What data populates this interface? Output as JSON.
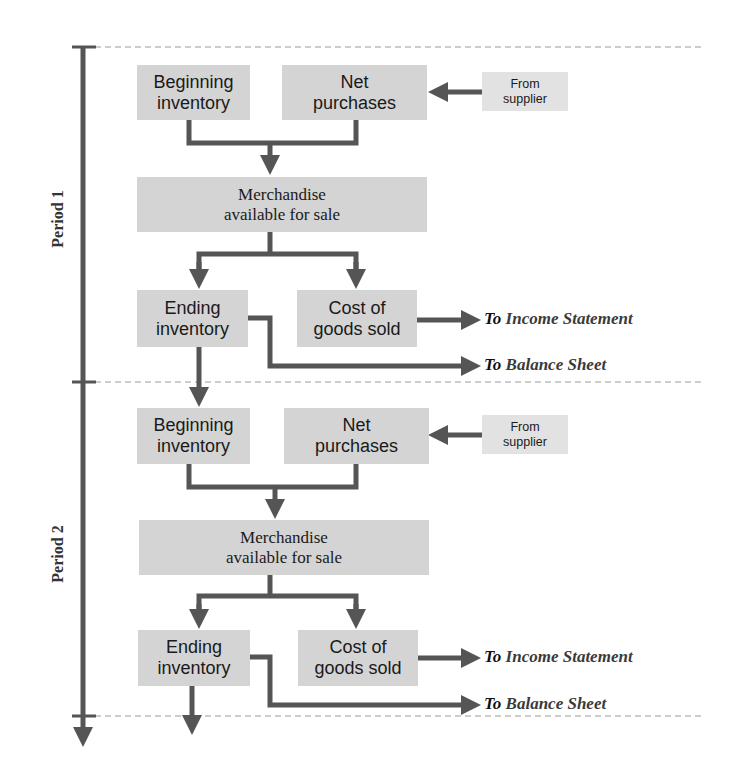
{
  "diagram": {
    "type": "flowchart",
    "colors": {
      "box_fill": "#d4d4d4",
      "supplier_fill": "#e2e2e2",
      "arrow": "#555555",
      "dashed_divider": "#9a9a9a",
      "text": "#1a1a1a"
    },
    "periods": [
      {
        "label": "Period 1",
        "beginning_inventory": "Beginning inventory",
        "beginning_inventory_lines": [
          "Beginning",
          "inventory"
        ],
        "net_purchases_lines": [
          "Net",
          "purchases"
        ],
        "from_supplier_lines": [
          "From",
          "supplier"
        ],
        "merchandise_lines": [
          "Merchandise",
          "available for sale"
        ],
        "ending_inventory_lines": [
          "Ending",
          "inventory"
        ],
        "cogs_lines": [
          "Cost of",
          "goods sold"
        ],
        "to_income": {
          "to": "To",
          "name": "Income Statement"
        },
        "to_balance": {
          "to": "To",
          "name": "Balance Sheet"
        }
      },
      {
        "label": "Period 2",
        "beginning_inventory_lines": [
          "Beginning",
          "inventory"
        ],
        "net_purchases_lines": [
          "Net",
          "purchases"
        ],
        "from_supplier_lines": [
          "From",
          "supplier"
        ],
        "merchandise_lines": [
          "Merchandise",
          "available for sale"
        ],
        "ending_inventory_lines": [
          "Ending",
          "inventory"
        ],
        "cogs_lines": [
          "Cost of",
          "goods sold"
        ],
        "to_income": {
          "to": "To",
          "name": "Income Statement"
        },
        "to_balance": {
          "to": "To",
          "name": "Balance Sheet"
        }
      }
    ]
  }
}
